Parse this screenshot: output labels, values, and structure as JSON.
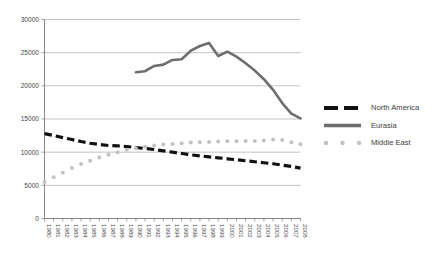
{
  "chart_data": {
    "type": "line",
    "title": "",
    "subtitle": "",
    "xlabel": "",
    "ylabel": "",
    "xlim": [
      1980,
      2008
    ],
    "ylim": [
      0,
      30000
    ],
    "ytick_labels": [
      "0",
      "5000",
      "10000",
      "15000",
      "20000",
      "25000",
      "30000"
    ],
    "ytick_values": [
      0,
      5000,
      10000,
      15000,
      20000,
      25000,
      30000
    ],
    "grid": "horizontal",
    "legend_position": "right",
    "x": [
      1980,
      1981,
      1982,
      1983,
      1984,
      1985,
      1986,
      1987,
      1988,
      1989,
      1990,
      1991,
      1992,
      1993,
      1994,
      1995,
      1996,
      1997,
      1998,
      1999,
      2000,
      2001,
      2002,
      2003,
      2004,
      2005,
      2006,
      2007,
      2008
    ],
    "xtick_labels": [
      "1980",
      "1981",
      "1982",
      "1983",
      "1984",
      "1985",
      "1986",
      "1987",
      "1988",
      "1989",
      "1990",
      "1991",
      "1992",
      "1993",
      "1994",
      "1995",
      "1996",
      "1997",
      "1998",
      "1999",
      "2000",
      "2001",
      "2002",
      "2003",
      "2004",
      "2005",
      "2006",
      "2007",
      "2008"
    ],
    "series": [
      {
        "name": "North America",
        "style": "dashed",
        "color": "#111111",
        "values": [
          12800,
          12500,
          12200,
          11900,
          11600,
          11350,
          11150,
          11000,
          10950,
          10850,
          10700,
          10550,
          10400,
          10200,
          10000,
          9800,
          9600,
          9450,
          9300,
          9150,
          9000,
          8850,
          8700,
          8550,
          8400,
          8250,
          8050,
          7850,
          7600
        ]
      },
      {
        "name": "Eurasia",
        "style": "solid",
        "color": "#6e6e6e",
        "values": [
          null,
          null,
          null,
          null,
          null,
          null,
          null,
          null,
          null,
          null,
          22050,
          22200,
          23000,
          23200,
          23900,
          24000,
          25300,
          26000,
          26450,
          24500,
          25150,
          24400,
          23400,
          22300,
          21000,
          19400,
          17400,
          15800,
          15100
        ]
      },
      {
        "name": "Middle East",
        "style": "dotted",
        "color": "#c2c2c2",
        "values": [
          5500,
          6200,
          6900,
          7600,
          8200,
          8700,
          9200,
          9600,
          10000,
          10350,
          10600,
          10800,
          11000,
          11150,
          11250,
          11350,
          11450,
          11500,
          11550,
          11600,
          11650,
          11650,
          11700,
          11700,
          11750,
          11900,
          11850,
          11500,
          11200
        ]
      }
    ]
  },
  "legend": {
    "items": [
      {
        "label": "North America"
      },
      {
        "label": "Eurasia"
      },
      {
        "label": "Middle East"
      }
    ]
  }
}
